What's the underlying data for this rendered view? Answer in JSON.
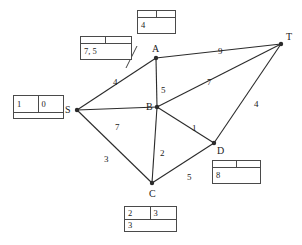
{
  "diagram": {
    "type": "weighted-graph",
    "stroke_color": "#2b2b2b",
    "text_color": "#1a1a1a",
    "box_border_color": "#4a4a4a",
    "background": "#ffffff",
    "nodes": [
      {
        "id": "S",
        "label": "S",
        "x": 77,
        "y": 110
      },
      {
        "id": "A",
        "label": "A",
        "x": 156,
        "y": 58
      },
      {
        "id": "B",
        "label": "B",
        "x": 157,
        "y": 107
      },
      {
        "id": "C",
        "label": "C",
        "x": 152,
        "y": 183
      },
      {
        "id": "D",
        "label": "D",
        "x": 214,
        "y": 143
      },
      {
        "id": "T",
        "label": "T",
        "x": 281,
        "y": 44
      }
    ],
    "edges": [
      {
        "from": "S",
        "to": "A",
        "weight": "4",
        "wx": 113,
        "wy": 78
      },
      {
        "from": "S",
        "to": "B",
        "weight": "7",
        "wx": 115,
        "wy": 123
      },
      {
        "from": "S",
        "to": "C",
        "weight": "3",
        "wx": 104,
        "wy": 155
      },
      {
        "from": "A",
        "to": "B",
        "weight": "5",
        "wx": 161,
        "wy": 86
      },
      {
        "from": "A",
        "to": "T",
        "weight": "9",
        "wx": 218,
        "wy": 47
      },
      {
        "from": "B",
        "to": "C",
        "weight": "2",
        "wx": 160,
        "wy": 149
      },
      {
        "from": "B",
        "to": "D",
        "weight": "1",
        "wx": 192,
        "wy": 124
      },
      {
        "from": "B",
        "to": "T",
        "weight": "7",
        "wx": 207,
        "wy": 78
      },
      {
        "from": "C",
        "to": "D",
        "weight": "5",
        "wx": 187,
        "wy": 173
      },
      {
        "from": "D",
        "to": "T",
        "weight": "4",
        "wx": 254,
        "wy": 100
      }
    ],
    "leaders": [
      {
        "name": "leader-a-to-sa-edge",
        "x1": 137,
        "y1": 46,
        "x2": 126,
        "y2": 68
      }
    ],
    "label_boxes": [
      {
        "name": "label-box-a",
        "for_node": "A",
        "x": 137,
        "y": 10,
        "w": 39,
        "h": 24,
        "top_left": "",
        "top_right": "",
        "bottom": "4"
      },
      {
        "name": "label-box-sa",
        "for_node": "A-alt",
        "x": 80,
        "y": 36,
        "w": 52,
        "h": 24,
        "top_left": "",
        "top_right": "",
        "bottom": "7, 5"
      },
      {
        "name": "label-box-s",
        "for_node": "S",
        "x": 13,
        "y": 95,
        "w": 51,
        "h": 24,
        "top_left": "1",
        "top_right": "0",
        "bottom": ""
      },
      {
        "name": "label-box-d",
        "for_node": "D",
        "x": 212,
        "y": 160,
        "w": 49,
        "h": 24,
        "top_left": "",
        "top_right": "",
        "bottom": "8"
      },
      {
        "name": "label-box-c",
        "for_node": "C",
        "x": 124,
        "y": 206,
        "w": 53,
        "h": 26,
        "top_left": "2",
        "top_right": "3",
        "bottom": "3"
      }
    ]
  }
}
